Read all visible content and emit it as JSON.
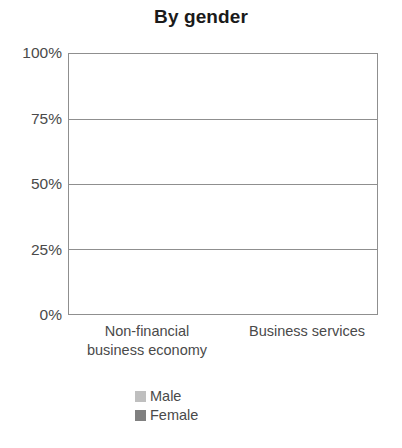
{
  "chart_data": {
    "type": "bar",
    "subtype": "stacked-percentage-column",
    "title": "By gender",
    "xlabel": "",
    "ylabel": "",
    "categories": [
      "Non-financial\nbusiness economy",
      "Business services"
    ],
    "series": [
      {
        "name": "Male",
        "values": [
          64,
          55
        ],
        "color": "#bfbfbf"
      },
      {
        "name": "Female",
        "values": [
          36,
          45
        ],
        "color": "#808080"
      }
    ],
    "stack_order": [
      "Female",
      "Male"
    ],
    "ylim": [
      0,
      100
    ],
    "yticks": [
      0,
      25,
      50,
      75,
      100
    ],
    "ytick_labels": [
      "0%",
      "25%",
      "50%",
      "75%",
      "100%"
    ],
    "grid": true,
    "grid_axis": "y",
    "legend_position": "bottom"
  },
  "colors": {
    "male": "#bfbfbf",
    "female": "#808080",
    "axis": "#8f8f8f",
    "text": "#4a4a4a",
    "title": "#1a1a1a",
    "background": "#ffffff"
  },
  "axis": {
    "y_ticks": [
      {
        "label": "100%",
        "value": 100
      },
      {
        "label": "75%",
        "value": 75
      },
      {
        "label": "50%",
        "value": 50
      },
      {
        "label": "25%",
        "value": 25
      },
      {
        "label": "0%",
        "value": 0
      }
    ]
  },
  "bars": [
    {
      "category": "Non-financial\nbusiness economy",
      "segments": [
        {
          "name": "Female",
          "value": 36
        },
        {
          "name": "Male",
          "value": 64
        }
      ]
    },
    {
      "category": "Business services",
      "segments": [
        {
          "name": "Female",
          "value": 45
        },
        {
          "name": "Male",
          "value": 55
        }
      ]
    }
  ],
  "legend": {
    "items": [
      {
        "label": "Male",
        "color": "#bfbfbf"
      },
      {
        "label": "Female",
        "color": "#808080"
      }
    ]
  }
}
